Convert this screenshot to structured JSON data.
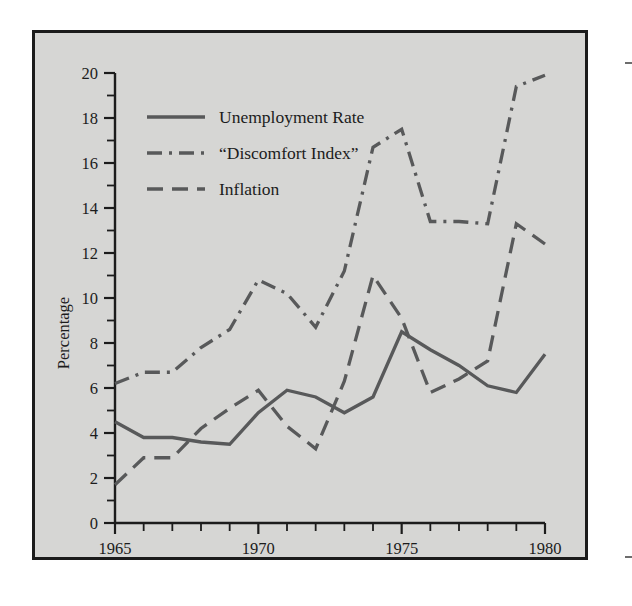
{
  "figure": {
    "background_color": "#ffffff",
    "plot_background_color": "#d6d6d4",
    "border_color": "#1b1b1b",
    "line_color": "#58595a"
  },
  "axes": {
    "y_title": "Percentage",
    "y_ticks_major": [
      "0",
      "2",
      "4",
      "6",
      "8",
      "10",
      "12",
      "14",
      "16",
      "18",
      "20"
    ],
    "x_ticks_major": [
      "1965",
      "1970",
      "1975",
      "1980"
    ]
  },
  "legend": {
    "items": [
      {
        "label": "Unemployment Rate",
        "style": "solid"
      },
      {
        "label": "“Discomfort Index”",
        "style": "dash-dot"
      },
      {
        "label": "Inflation",
        "style": "dashed"
      }
    ]
  },
  "chart_data": {
    "type": "line",
    "title": "",
    "xlabel": "",
    "ylabel": "Percentage",
    "xlim": [
      1965,
      1980
    ],
    "ylim": [
      0,
      20
    ],
    "grid": false,
    "legend_position": "top-left",
    "x": [
      1965,
      1966,
      1967,
      1968,
      1969,
      1970,
      1971,
      1972,
      1973,
      1974,
      1975,
      1976,
      1977,
      1978,
      1979,
      1980
    ],
    "series": [
      {
        "name": "Unemployment Rate",
        "style": "solid",
        "values": [
          4.5,
          3.8,
          3.8,
          3.6,
          3.5,
          4.9,
          5.9,
          5.6,
          4.9,
          5.6,
          8.5,
          7.7,
          7.0,
          6.1,
          5.8,
          7.5
        ]
      },
      {
        "name": "“Discomfort Index”",
        "style": "dash-dot",
        "values": [
          6.2,
          6.7,
          6.7,
          7.8,
          8.6,
          10.8,
          10.2,
          8.7,
          11.2,
          16.7,
          17.5,
          13.4,
          13.4,
          13.3,
          19.4,
          19.9
        ]
      },
      {
        "name": "Inflation",
        "style": "dashed",
        "values": [
          1.7,
          2.9,
          2.9,
          4.2,
          5.1,
          5.9,
          4.3,
          3.3,
          6.3,
          11.0,
          9.1,
          5.8,
          6.4,
          7.2,
          13.3,
          12.4
        ]
      }
    ]
  }
}
